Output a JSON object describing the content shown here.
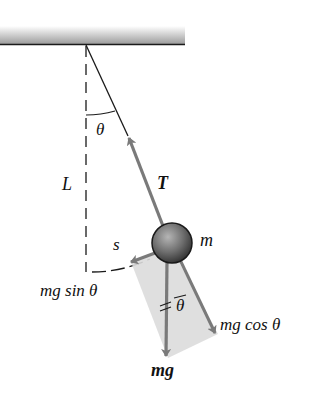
{
  "diagram": {
    "type": "simple-pendulum-free-body",
    "labels": {
      "angle_top": "θ",
      "length": "L",
      "tension": "T",
      "mass": "m",
      "arc": "s",
      "tangential_force": "mg sin θ",
      "radial_force": "mg cos θ",
      "gravity": "mg",
      "angle_bottom": "θ"
    },
    "colors": {
      "arrow": "#7a7a7a",
      "shade": "#d9d9d9",
      "line": "#1a1a1a",
      "bob_dark": "#3a3a3a",
      "bob_light": "#9a9a9a"
    }
  }
}
